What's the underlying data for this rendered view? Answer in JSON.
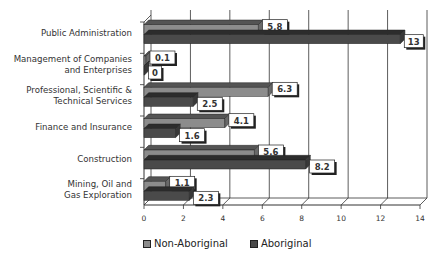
{
  "chart_data": {
    "type": "bar",
    "orientation": "horizontal",
    "title": "",
    "xlabel": "",
    "ylabel": "",
    "xlim": [
      0,
      14
    ],
    "x_ticks": [
      0,
      2,
      4,
      6,
      8,
      10,
      12,
      14
    ],
    "grid": true,
    "style": "3d",
    "legend_position": "bottom",
    "categories": [
      "Public Administration",
      "Management of Companies and Enterprises",
      "Professional, Scientific & Technical Services",
      "Finance and Insurance",
      "Construction",
      "Mining, Oil and Gas Exploration"
    ],
    "category_lines": [
      [
        "Public Administration"
      ],
      [
        "Management of Companies",
        "and Enterprises"
      ],
      [
        "Professional, Scientific &",
        "Technical  Services"
      ],
      [
        "Finance and Insurance"
      ],
      [
        "Construction"
      ],
      [
        "Mining,  Oil and",
        "Gas Exploration"
      ]
    ],
    "series": [
      {
        "name": "Non-Aboriginal",
        "color": "#8c8c8c",
        "values": [
          5.8,
          0.1,
          6.3,
          4.1,
          5.6,
          1.1
        ]
      },
      {
        "name": "Aboriginal",
        "color": "#4a4a4a",
        "values": [
          13,
          0,
          2.5,
          1.6,
          8.2,
          2.3
        ]
      }
    ],
    "data_labels": {
      "Non-Aboriginal": [
        "5.8",
        "0.1",
        "6.3",
        "4.1",
        "5.6",
        "1.1"
      ],
      "Aboriginal": [
        "13",
        "0",
        "2.5",
        "1.6",
        "8.2",
        "2.3"
      ]
    }
  },
  "legend": {
    "items": [
      {
        "label": "Non-Aboriginal",
        "color": "#8c8c8c"
      },
      {
        "label": "Aboriginal",
        "color": "#4a4a4a"
      }
    ]
  }
}
